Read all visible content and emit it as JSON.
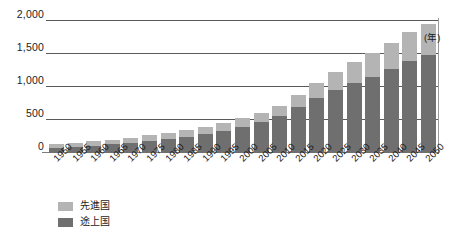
{
  "chart_data": {
    "type": "bar",
    "stacked": true,
    "title": "",
    "subtitle": "",
    "xlabel": "(年)",
    "ylabel": "",
    "ylim": [
      0,
      2000
    ],
    "yticks": [
      "0",
      "500",
      "1,000",
      "1,500",
      "2,000"
    ],
    "ytick_values": [
      0,
      500,
      1000,
      1500,
      2000
    ],
    "grid": true,
    "legend_position": "bottom-left",
    "categories": [
      "1950",
      "1955",
      "1960",
      "1965",
      "1970",
      "1975",
      "1980",
      "1985",
      "1990",
      "1995",
      "2000",
      "2005",
      "2010",
      "2015",
      "2020",
      "2025",
      "2030",
      "2035",
      "2040",
      "2045",
      "2050"
    ],
    "series": [
      {
        "name": "途上国",
        "color": "#6f6f6f",
        "values": [
          80,
          95,
          110,
          130,
          155,
          185,
          215,
          250,
          290,
          340,
          400,
          470,
          560,
          690,
          830,
          960,
          1060,
          1150,
          1270,
          1390,
          1480
        ]
      },
      {
        "name": "先進国",
        "color": "#b4b4b4",
        "values": [
          55,
          60,
          65,
          70,
          75,
          85,
          90,
          95,
          105,
          115,
          125,
          140,
          160,
          190,
          230,
          270,
          320,
          360,
          400,
          450,
          480
        ]
      }
    ],
    "totals": [
      135,
      155,
      175,
      200,
      230,
      270,
      305,
      345,
      395,
      455,
      525,
      610,
      720,
      880,
      1060,
      1230,
      1380,
      1510,
      1670,
      1840,
      1960
    ]
  },
  "legend": {
    "items": [
      {
        "label": "先進国",
        "swatch": "developed"
      },
      {
        "label": "途上国",
        "swatch": "developing"
      }
    ]
  },
  "axis": {
    "x_unit": "(年)"
  }
}
